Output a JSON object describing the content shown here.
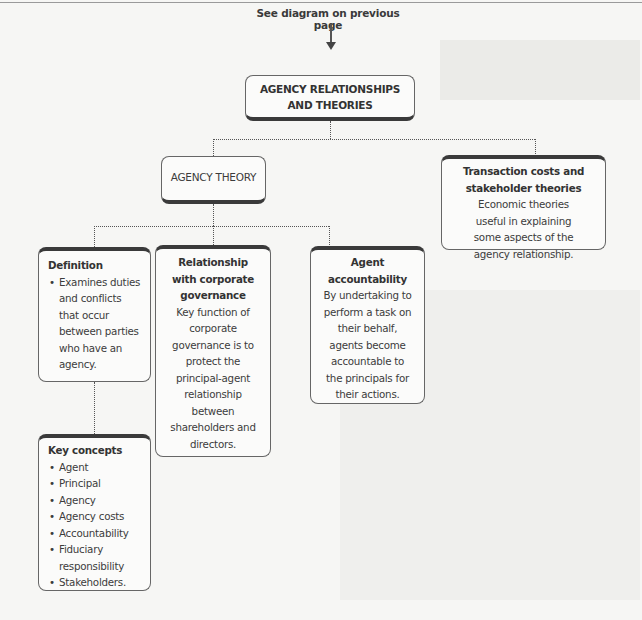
{
  "caption": "See diagram on previous page",
  "root": {
    "line1": "AGENCY RELATIONSHIPS",
    "line2": "AND THEORIES"
  },
  "agency_theory": {
    "label": "AGENCY THEORY"
  },
  "transaction": {
    "title_line1": "Transaction costs and",
    "title_line2": "stakeholder theories",
    "body": [
      "Economic theories",
      "useful in explaining",
      "some aspects of the",
      "agency relationship."
    ]
  },
  "definition": {
    "title": "Definition",
    "bullets": [
      "Examines duties and conflicts that occur between parties who have an agency."
    ]
  },
  "governance": {
    "title": [
      "Relationship",
      "with corporate",
      "governance"
    ],
    "body": [
      "Key function of",
      "corporate",
      "governance is to",
      "protect the",
      "principal-agent",
      "relationship",
      "between",
      "shareholders and",
      "directors."
    ]
  },
  "accountability": {
    "title": [
      "Agent",
      "accountability"
    ],
    "body": [
      "By undertaking to",
      "perform a task on",
      "their behalf,",
      "agents become",
      "accountable to",
      "the principals for",
      "their actions."
    ]
  },
  "key_concepts": {
    "title": "Key concepts",
    "items": [
      "Agent",
      "Principal",
      "Agency",
      "Agency costs",
      "Accountability",
      "Fiduciary responsibility",
      "Stakeholders."
    ]
  }
}
